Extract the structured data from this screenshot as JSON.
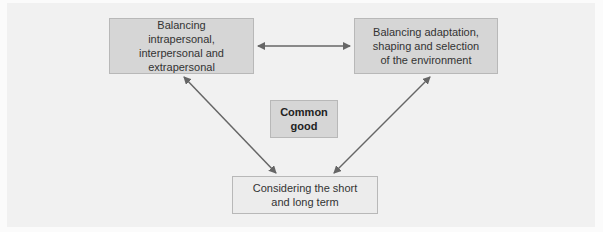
{
  "diagram": {
    "nodes": {
      "left": {
        "label": "Balancing intrapersonal, interpersonal and extrapersonal"
      },
      "right": {
        "label": "Balancing adaptation, shaping and selection of the environment"
      },
      "center": {
        "label": "Common good"
      },
      "bottom": {
        "label": "Considering the short and long term"
      }
    },
    "edges": [
      {
        "from": "left",
        "to": "right",
        "type": "bidirectional"
      },
      {
        "from": "left",
        "to": "bottom",
        "type": "bidirectional"
      },
      {
        "from": "right",
        "to": "bottom",
        "type": "bidirectional"
      }
    ],
    "colors": {
      "box_dark": "#d6d6d6",
      "box_light": "#ececec",
      "arrow": "#666666",
      "background": "#f1f1f1"
    }
  }
}
